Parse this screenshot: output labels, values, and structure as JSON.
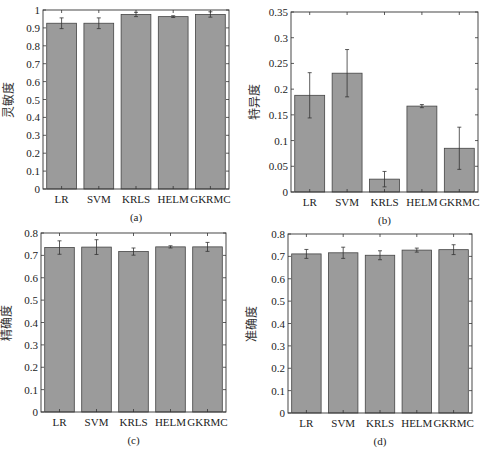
{
  "chart_data": [
    {
      "id": "a",
      "type": "bar",
      "caption": "(a)",
      "ylabel": "灵敏度",
      "xlabel": "",
      "categories": [
        "LR",
        "SVM",
        "KRLS",
        "HELM",
        "GKRMC"
      ],
      "values": [
        0.926,
        0.926,
        0.975,
        0.963,
        0.975
      ],
      "errors": [
        0.03,
        0.03,
        0.012,
        0.005,
        0.015
      ],
      "ylim": [
        0,
        1
      ],
      "yticks": [
        0,
        0.1,
        0.2,
        0.3,
        0.4,
        0.5,
        0.6,
        0.7,
        0.8,
        0.9,
        1
      ],
      "ytick_labels": [
        "0",
        "0.1",
        "0.2",
        "0.3",
        "0.4",
        "0.5",
        "0.6",
        "0.7",
        "0.8",
        "0.9",
        "1"
      ],
      "grid": false,
      "box": {
        "left": 43,
        "right": 229,
        "top": 10,
        "bottom": 189
      }
    },
    {
      "id": "b",
      "type": "bar",
      "caption": "(b)",
      "ylabel": "特异度",
      "xlabel": "",
      "categories": [
        "LR",
        "SVM",
        "KRLS",
        "HELM",
        "GKRMC"
      ],
      "values": [
        0.188,
        0.231,
        0.025,
        0.167,
        0.085
      ],
      "errors": [
        0.044,
        0.046,
        0.015,
        0.003,
        0.041
      ],
      "ylim": [
        0,
        0.35
      ],
      "yticks": [
        0,
        0.05,
        0.1,
        0.15,
        0.2,
        0.25,
        0.3,
        0.35
      ],
      "ytick_labels": [
        "0",
        "0.05",
        "0.1",
        "0.15",
        "0.2",
        "0.25",
        "0.3",
        "0.35"
      ],
      "grid": false,
      "box": {
        "left": 291,
        "right": 478,
        "top": 12,
        "bottom": 192
      }
    },
    {
      "id": "c",
      "type": "bar",
      "caption": "(c)",
      "ylabel": "精确度",
      "xlabel": "",
      "categories": [
        "LR",
        "SVM",
        "KRLS",
        "HELM",
        "GKRMC"
      ],
      "values": [
        0.735,
        0.737,
        0.717,
        0.738,
        0.738
      ],
      "errors": [
        0.03,
        0.033,
        0.016,
        0.005,
        0.02
      ],
      "ylim": [
        0,
        0.8
      ],
      "yticks": [
        0,
        0.1,
        0.2,
        0.3,
        0.4,
        0.5,
        0.6,
        0.7,
        0.8
      ],
      "ytick_labels": [
        "0",
        "0.1",
        "0.2",
        "0.3",
        "0.4",
        "0.5",
        "0.6",
        "0.7",
        "0.8"
      ],
      "grid": false,
      "box": {
        "left": 41,
        "right": 226,
        "top": 233,
        "bottom": 412
      }
    },
    {
      "id": "d",
      "type": "bar",
      "caption": "(d)",
      "ylabel": "准确度",
      "xlabel": "",
      "categories": [
        "LR",
        "SVM",
        "KRLS",
        "HELM",
        "GKRMC"
      ],
      "values": [
        0.711,
        0.716,
        0.705,
        0.728,
        0.73
      ],
      "errors": [
        0.02,
        0.025,
        0.02,
        0.009,
        0.022
      ],
      "ylim": [
        0,
        0.8
      ],
      "yticks": [
        0,
        0.1,
        0.2,
        0.3,
        0.4,
        0.5,
        0.6,
        0.7,
        0.8
      ],
      "ytick_labels": [
        "0",
        "0.1",
        "0.2",
        "0.3",
        "0.4",
        "0.5",
        "0.6",
        "0.7",
        "0.8"
      ],
      "grid": false,
      "box": {
        "left": 288,
        "right": 472,
        "top": 234,
        "bottom": 413
      }
    }
  ],
  "style": {
    "bar_fill": "#9b9b9b",
    "bar_edge": "#444444",
    "axis_color": "#333333",
    "error_color": "#333333"
  }
}
